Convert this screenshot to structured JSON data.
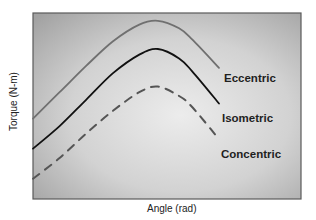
{
  "chart_data": {
    "type": "line",
    "title": "",
    "xlabel": "Angle (rad)",
    "ylabel": "Torque (N-m)",
    "x_ticks": [],
    "y_ticks": [],
    "grid": false,
    "legend": "inline labels at right end of each curve",
    "x": [
      0,
      0.1,
      0.2,
      0.3,
      0.4,
      0.47,
      0.55,
      0.6,
      0.7
    ],
    "series": [
      {
        "name": "Eccentric",
        "style": "solid",
        "color": "#707070",
        "values": [
          0.38,
          0.52,
          0.66,
          0.79,
          0.88,
          0.9,
          0.86,
          0.8,
          0.65
        ]
      },
      {
        "name": "Isometric",
        "style": "solid",
        "color": "#111111",
        "values": [
          0.22,
          0.34,
          0.48,
          0.62,
          0.72,
          0.75,
          0.7,
          0.63,
          0.46
        ]
      },
      {
        "name": "Concentric",
        "style": "dashed",
        "color": "#555555",
        "values": [
          0.06,
          0.17,
          0.3,
          0.42,
          0.52,
          0.55,
          0.5,
          0.44,
          0.27
        ]
      }
    ]
  },
  "labels": {
    "eccentric": "Eccentric",
    "isometric": "Isometric",
    "concentric": "Concentric",
    "xaxis": "Angle (rad)",
    "yaxis": "Torque (N-m)"
  }
}
